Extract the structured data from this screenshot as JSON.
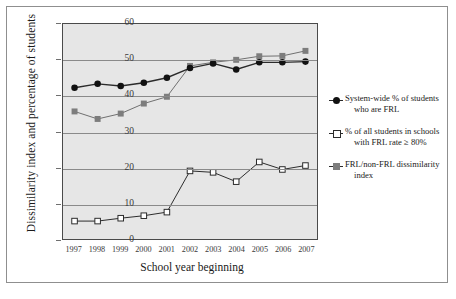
{
  "chart_data": {
    "type": "line",
    "title": "",
    "xlabel": "School year beginning",
    "ylabel": "Dissimilarity index and percentage of students",
    "categories": [
      "1997",
      "1998",
      "1999",
      "2000",
      "2001",
      "2002",
      "2003",
      "2004",
      "2005",
      "2006",
      "2007"
    ],
    "x": [
      1997,
      1998,
      1999,
      2000,
      2001,
      2002,
      2003,
      2004,
      2005,
      2006,
      2007
    ],
    "ylim": [
      0,
      60
    ],
    "yticks": [
      0,
      10,
      20,
      30,
      40,
      50,
      60
    ],
    "grid": true,
    "legend_position": "right",
    "plot_background": "#e6e6e6",
    "series": [
      {
        "name": "System-wide % of students who are FRL",
        "marker": "filled-circle",
        "color": "#111111",
        "values": [
          42.2,
          43.3,
          42.7,
          43.6,
          45.0,
          47.7,
          49.0,
          47.3,
          49.3,
          49.3,
          49.5
        ]
      },
      {
        "name": "% of all students in schools with FRL rate ≥ 80%",
        "marker": "open-square",
        "color": "#2b2b2b",
        "values": [
          5.0,
          5.0,
          5.8,
          6.5,
          7.5,
          19.0,
          18.6,
          16.0,
          21.5,
          19.4,
          20.5
        ]
      },
      {
        "name": "FRL/non-FRL dissimilarity index",
        "marker": "filled-gray-square",
        "color": "#7d7d7d",
        "values": [
          35.6,
          33.5,
          35.0,
          37.8,
          39.7,
          48.3,
          49.3,
          50.0,
          51.0,
          51.1,
          52.5
        ]
      }
    ]
  },
  "legend": {
    "items": [
      {
        "line1": "System-wide % of students",
        "line2": "who are FRL",
        "marker": "filled-circle"
      },
      {
        "line1": "% of all students in schools",
        "line2": "with FRL rate ≥ 80%",
        "marker": "open-square"
      },
      {
        "line1": "FRL/non-FRL dissimilarity",
        "line2": "index",
        "marker": "filled-gray-square"
      }
    ]
  }
}
